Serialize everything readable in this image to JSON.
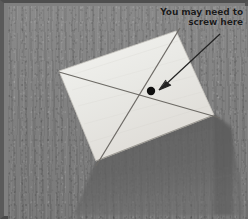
{
  "figure": {
    "name": "instructional-photo",
    "width": 248,
    "height": 219
  },
  "annotation": {
    "callout_lines": [
      "You may need to",
      "screw here"
    ],
    "full_text": "You may need to screw here",
    "text_color": "#1b1b1b",
    "arrow": {
      "name": "callout-arrow",
      "color": "#2a2a2a",
      "start": [
        212,
        29
      ],
      "end": [
        152,
        84
      ]
    },
    "marker_dot": {
      "name": "screw-location-dot",
      "color": "#121212",
      "center": [
        147,
        87
      ],
      "radius": 4
    }
  },
  "scene": {
    "background_color": "#7f7f7f",
    "panel_color": "#ededea",
    "shadow_color": "#5d5d5d",
    "panel": {
      "name": "white-panel",
      "corners": {
        "left": [
          55,
          68
        ],
        "top": [
          172,
          28
        ],
        "right": [
          210,
          112
        ],
        "bottom": [
          92,
          158
        ]
      },
      "diagonals": [
        {
          "name": "diagonal-line-a",
          "from": [
            55,
            68
          ],
          "to": [
            210,
            112
          ]
        },
        {
          "name": "diagonal-line-b",
          "from": [
            172,
            28
          ],
          "to": [
            92,
            158
          ]
        }
      ]
    },
    "frame_color": "#4e4e4e"
  }
}
